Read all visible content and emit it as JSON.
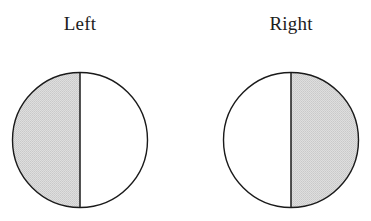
{
  "figure": {
    "background_color": "#ffffff",
    "stroke_color": "#1a1a1a",
    "shade_color": "#d6d6d6",
    "panels": [
      {
        "label": "Left",
        "shape": "circle",
        "divider": "vertical",
        "shaded_half": "left"
      },
      {
        "label": "Right",
        "shape": "circle",
        "divider": "vertical",
        "shaded_half": "right"
      }
    ]
  }
}
